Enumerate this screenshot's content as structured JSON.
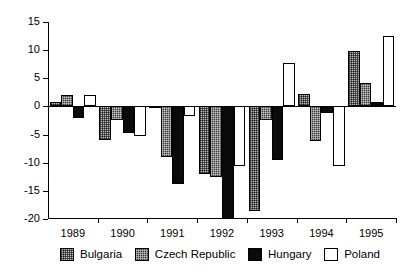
{
  "chart_data": {
    "type": "bar",
    "title": "",
    "subtitle": "",
    "xlabel": "",
    "ylabel": "",
    "categories": [
      "1989",
      "1990",
      "1991",
      "1992",
      "1993",
      "1994",
      "1995"
    ],
    "ylim": [
      -20,
      15
    ],
    "yticks": [
      15,
      10,
      5,
      0,
      -5,
      -10,
      -15,
      -20
    ],
    "ytick_labels": [
      "15",
      "10",
      "5",
      "0",
      "-5",
      "-10",
      "-15",
      "-20"
    ],
    "grid": false,
    "legend_position": "bottom",
    "series": [
      {
        "name": "Bulgaria",
        "fill": "light-stipple",
        "color": "#bdbdbd",
        "values": [
          0.8,
          -6.0,
          -0.3,
          -12.0,
          -18.5,
          2.2,
          9.8
        ]
      },
      {
        "name": "Czech Republic",
        "fill": "dark-stipple",
        "color": "#3a3a3a",
        "values": [
          2.0,
          -2.5,
          -9.0,
          -12.5,
          -2.5,
          -6.2,
          4.1
        ]
      },
      {
        "name": "Hungary",
        "fill": "solid-black",
        "color": "#0a0a0a",
        "values": [
          -2.0,
          -4.7,
          -13.7,
          -20.0,
          -9.5,
          -1.2,
          0.7
        ]
      },
      {
        "name": "Poland",
        "fill": "white",
        "color": "#ffffff",
        "values": [
          2.0,
          -5.3,
          -1.7,
          -10.5,
          7.7,
          -10.6,
          12.5
        ]
      }
    ]
  },
  "legend": {
    "items": [
      {
        "label": "Bulgaria"
      },
      {
        "label": "Czech Republic"
      },
      {
        "label": "Hungary"
      },
      {
        "label": "Poland"
      }
    ]
  }
}
